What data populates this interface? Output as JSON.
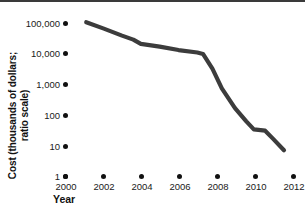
{
  "figure": {
    "background_color": "#ffffff",
    "rule_color": "#3a3a3a",
    "line_color": "#3c3c3c",
    "tick_color": "#111111"
  },
  "axes": {
    "y_title_line1": "Cost (thousands of dollars;",
    "y_title_line2": "ratio scale)",
    "x_title": "Year"
  },
  "chart_data": {
    "type": "line",
    "title": "",
    "subtitle": "",
    "xlabel": "Year",
    "ylabel": "Cost (thousands of dollars; ratio scale)",
    "y_scale": "log",
    "grid": false,
    "legend": "none",
    "xlim": [
      2000,
      2012
    ],
    "ylim": [
      1,
      100000
    ],
    "x_tick_labels": [
      "2000",
      "2002",
      "2004",
      "2006",
      "2008",
      "2010",
      "2012"
    ],
    "x_ticks": [
      2000,
      2002,
      2004,
      2006,
      2008,
      2010,
      2012
    ],
    "y_tick_labels": [
      "1",
      "10",
      "100",
      "1,000",
      "10,000",
      "100,000"
    ],
    "y_ticks": [
      1,
      10,
      100,
      1000,
      10000,
      100000
    ],
    "series": [
      {
        "name": "Cost",
        "x": [
          2001.1,
          2002.0,
          2003.0,
          2003.6,
          2004.0,
          2005.0,
          2006.0,
          2007.0,
          2007.3,
          2007.8,
          2008.3,
          2009.0,
          2009.6,
          2010.0,
          2010.6,
          2011.0,
          2011.6
        ],
        "y": [
          95000,
          60000,
          35000,
          26000,
          19000,
          15500,
          12000,
          10000,
          9000,
          3000,
          700,
          160,
          60,
          33,
          30,
          17,
          7
        ]
      }
    ]
  }
}
